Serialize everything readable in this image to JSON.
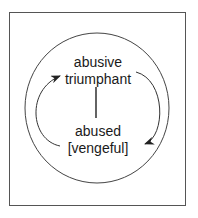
{
  "diagram": {
    "top_label_line1": "abusive",
    "top_label_line2": "triumphant",
    "bottom_label_line1": "abused",
    "bottom_label_line2": "[vengeful]",
    "stroke_color": "#333333"
  }
}
